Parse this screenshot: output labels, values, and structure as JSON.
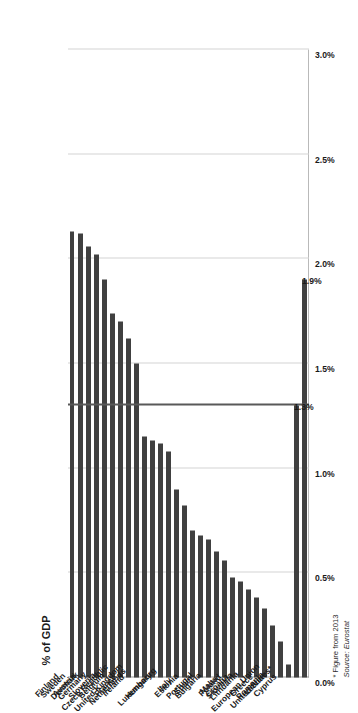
{
  "chart_data": {
    "type": "bar",
    "orientation": "vertical-bars-rendered-sideways",
    "title": "",
    "xlabel": "",
    "ylabel": "% of GDP",
    "ylim": [
      0.0,
      3.0
    ],
    "ytick_labels": [
      "0.0%",
      "0.5%",
      "1.0%",
      "1.5%",
      "2.0%",
      "2.5%",
      "3.0%"
    ],
    "ytick_values": [
      0.0,
      0.5,
      1.0,
      1.5,
      2.0,
      2.5,
      3.0
    ],
    "grid": true,
    "legend": null,
    "bar_color": "#404040",
    "gridline_color": "#d4d4d4",
    "benchmark_line": {
      "value": 1.3,
      "color": "#595959",
      "label": "1.3%"
    },
    "categories": [
      "Finland",
      "Sweden",
      "Austria",
      "Denmark",
      "Germany",
      "Slovenia",
      "Belgium",
      "France",
      "Ireland",
      "Czech Republic",
      "Netherlands",
      "United Kingdom",
      "Hungary",
      "Italy",
      "Luxembourg",
      "Estonia",
      "Spain",
      "Portugal",
      "Bulgaria",
      "Malta",
      "Poland",
      "Croatia",
      "Slovakia",
      "Lithuania",
      "Greece",
      "Latvia",
      "Romania",
      "Cyprus",
      "European Union",
      "United States*"
    ],
    "values": [
      2.13,
      2.12,
      2.06,
      2.02,
      1.9,
      1.74,
      1.7,
      1.62,
      1.5,
      1.15,
      1.13,
      1.12,
      1.08,
      0.9,
      0.82,
      0.7,
      0.68,
      0.66,
      0.6,
      0.56,
      0.48,
      0.46,
      0.42,
      0.38,
      0.33,
      0.25,
      0.17,
      0.06,
      1.3,
      1.9
    ],
    "data_labels": {
      "United States*": "1.9%",
      "European Union": "1.3%"
    }
  },
  "footnote": {
    "line1": "* Figure from 2013",
    "line2": "Source: Eurostat"
  }
}
